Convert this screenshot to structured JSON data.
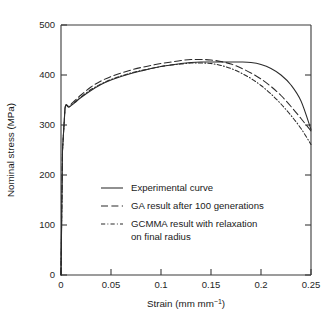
{
  "chart_data": {
    "type": "line",
    "title": "",
    "xlabel": "Strain (mm mm⁻¹)",
    "ylabel": "Nominal stress (MPa)",
    "xlim": [
      0,
      0.25
    ],
    "ylim": [
      0,
      500
    ],
    "xticks": [
      "0",
      "0.05",
      "0.1",
      "0.15",
      "0.2",
      "0.25"
    ],
    "xtick_values": [
      0,
      0.05,
      0.1,
      0.15,
      0.2,
      0.25
    ],
    "yticks": [
      "0",
      "100",
      "200",
      "300",
      "400",
      "500"
    ],
    "ytick_values": [
      0,
      100,
      200,
      300,
      400,
      500
    ],
    "grid": false,
    "legend_position": "center-left-inside",
    "series": [
      {
        "name": "Experimental curve",
        "style": "solid",
        "color": "#2b2b2b",
        "x": [
          0,
          0.0015,
          0.004,
          0.008,
          0.014,
          0.02,
          0.03,
          0.04,
          0.05,
          0.06,
          0.07,
          0.08,
          0.09,
          0.1,
          0.11,
          0.12,
          0.13,
          0.14,
          0.15,
          0.16,
          0.17,
          0.18,
          0.19,
          0.2,
          0.21,
          0.22,
          0.23,
          0.24,
          0.25
        ],
        "y": [
          0,
          250,
          333,
          336,
          345,
          355,
          369,
          381,
          390,
          397,
          403,
          408,
          413,
          417,
          420,
          423,
          425,
          426,
          426,
          426,
          426,
          426,
          425,
          421,
          413,
          400,
          380,
          348,
          291
        ]
      },
      {
        "name": "GA result after 100 generations",
        "style": "dashed",
        "color": "#2b2b2b",
        "x": [
          0,
          0.0015,
          0.004,
          0.008,
          0.014,
          0.02,
          0.03,
          0.04,
          0.05,
          0.06,
          0.07,
          0.08,
          0.09,
          0.1,
          0.11,
          0.12,
          0.13,
          0.14,
          0.15,
          0.16,
          0.17,
          0.18,
          0.19,
          0.2,
          0.21,
          0.22,
          0.23,
          0.24,
          0.25
        ],
        "y": [
          0,
          250,
          334,
          338,
          349,
          360,
          376,
          388,
          397,
          404,
          410,
          415,
          419,
          423,
          426,
          429,
          431,
          431,
          430,
          427,
          422,
          414,
          404,
          392,
          377,
          359,
          337,
          313,
          288
        ]
      },
      {
        "name": "GCMMA result with relaxation on final radius",
        "style": "dashdot",
        "color": "#2b2b2b",
        "x": [
          0,
          0.0015,
          0.004,
          0.008,
          0.014,
          0.02,
          0.03,
          0.04,
          0.05,
          0.06,
          0.07,
          0.08,
          0.09,
          0.1,
          0.11,
          0.12,
          0.13,
          0.14,
          0.15,
          0.16,
          0.17,
          0.18,
          0.19,
          0.2,
          0.21,
          0.22,
          0.23,
          0.24,
          0.25
        ],
        "y": [
          0,
          248,
          333,
          336,
          346,
          356,
          371,
          382,
          391,
          398,
          404,
          409,
          413,
          417,
          420,
          422,
          424,
          424,
          423,
          419,
          413,
          404,
          393,
          379,
          362,
          342,
          319,
          293,
          261
        ]
      }
    ],
    "legend_entries": [
      {
        "label": "Experimental curve",
        "style": "solid"
      },
      {
        "label": "GA result after 100 generations",
        "style": "dashed"
      },
      {
        "label": "GCMMA result with relaxation",
        "style": "dashdot"
      },
      {
        "label": "on final radius",
        "style": "none"
      }
    ]
  }
}
